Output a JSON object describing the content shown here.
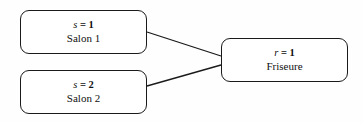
{
  "diagram": {
    "type": "entity-relationship-fragment",
    "stroke_color": "#1a1a1a",
    "background_color": "#fefefe",
    "nodes": [
      {
        "key": "salon_1",
        "variable": "s",
        "operator": "=",
        "value": "1",
        "id_text": "s = 1",
        "label": "Salon 1"
      },
      {
        "key": "salon_2",
        "variable": "s",
        "operator": "=",
        "value": "2",
        "id_text": "s = 2",
        "label": "Salon 2"
      },
      {
        "key": "friseure",
        "variable": "r",
        "operator": "=",
        "value": "1",
        "id_text": "r = 1",
        "label": "Friseure"
      }
    ],
    "edges": [
      {
        "key": "edge-salon-1-friseure",
        "from": "salon_1",
        "to": "friseure"
      },
      {
        "key": "edge-salon-2-friseure",
        "from": "salon_2",
        "to": "friseure"
      }
    ]
  }
}
